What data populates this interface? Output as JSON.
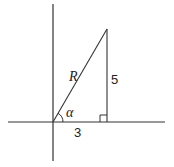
{
  "diagram": {
    "type": "right-triangle-on-axes",
    "colors": {
      "stroke": "#333333",
      "text": "#222222",
      "background": "#ffffff"
    },
    "axes": {
      "origin": {
        "x": 53,
        "y": 122
      },
      "x_axis": {
        "x1": 8,
        "x2": 165,
        "y": 122
      },
      "y_axis": {
        "x": 53,
        "y1": 4,
        "y2": 161
      }
    },
    "triangle": {
      "vertices": {
        "origin": {
          "x": 53,
          "y": 122
        },
        "foot": {
          "x": 107,
          "y": 122
        },
        "apex": {
          "x": 107,
          "y": 29
        }
      },
      "right_angle_marker": {
        "x": 100,
        "y": 115,
        "size": 7
      }
    },
    "labels": {
      "hypotenuse": "R",
      "opposite": "5",
      "adjacent": "3",
      "angle": "α"
    }
  }
}
